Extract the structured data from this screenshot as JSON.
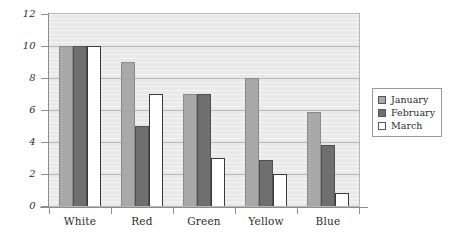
{
  "chart_data": {
    "type": "bar",
    "title": "",
    "subtitle": "",
    "xlabel": "",
    "ylabel": "",
    "categories": [
      "White",
      "Red",
      "Green",
      "Yellow",
      "Blue"
    ],
    "series": [
      {
        "name": "January",
        "color": "#a9a9a9",
        "values": [
          10,
          9,
          7,
          8,
          5.9
        ]
      },
      {
        "name": "February",
        "color": "#6f6f6f",
        "values": [
          10,
          5,
          7,
          2.9,
          3.8
        ]
      },
      {
        "name": "March",
        "color": "#ffffff",
        "values": [
          10,
          7,
          3,
          2,
          0.8
        ]
      }
    ],
    "ylim": [
      0,
      12
    ],
    "ytick_labels": [
      "12",
      "10",
      "8",
      "6",
      "4",
      "2",
      "0"
    ],
    "ytick_values": [
      12,
      10,
      8,
      6,
      4,
      2,
      0
    ],
    "grid": true,
    "grid_axis": "y",
    "legend_position": "right",
    "plot_background": "#e9e9e9",
    "grid_color": "#b9b9b9",
    "axis_color": "#8d8d8d"
  },
  "legend": {
    "entries": [
      {
        "label": "January"
      },
      {
        "label": "February"
      },
      {
        "label": "March"
      }
    ]
  }
}
